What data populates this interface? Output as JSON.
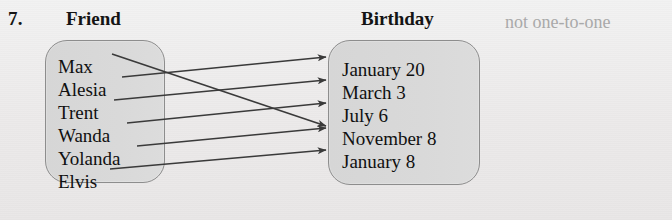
{
  "problem": {
    "number": "7."
  },
  "headers": {
    "domain": "Friend",
    "codomain": "Birthday"
  },
  "caption": {
    "text": "not one-to-one"
  },
  "colors": {
    "page_background": "#efefef",
    "oval_fill": "#d9d9d9",
    "oval_border": "#8d8d8d",
    "text": "#101010",
    "caption_text": "#a9a9a9",
    "arrow": "#3a3a3a"
  },
  "diagram": {
    "type": "mapping-diagram",
    "domain_label": "Friend",
    "codomain_label": "Birthday",
    "domain_items": [
      {
        "label": "Max",
        "x": 58,
        "y": 57
      },
      {
        "label": "Alesia",
        "x": 58,
        "y": 80
      },
      {
        "label": "Trent",
        "x": 58,
        "y": 103
      },
      {
        "label": "Wanda",
        "x": 58,
        "y": 126
      },
      {
        "label": "Yolanda",
        "x": 58,
        "y": 149
      },
      {
        "label": "Elvis",
        "x": 58,
        "y": 172
      }
    ],
    "codomain_items": [
      {
        "label": "January 20",
        "x": 342,
        "y": 60
      },
      {
        "label": "March 3",
        "x": 342,
        "y": 83
      },
      {
        "label": "July 6",
        "x": 342,
        "y": 106
      },
      {
        "label": "November 8",
        "x": 342,
        "y": 129
      },
      {
        "label": "January 8",
        "x": 342,
        "y": 152
      }
    ],
    "arrows": [
      {
        "from": "Max",
        "to": "November 8",
        "x1": 112,
        "y1": 54,
        "x2": 326,
        "y2": 126
      },
      {
        "from": "Alesia",
        "to": "January 20",
        "x1": 122,
        "y1": 77,
        "x2": 326,
        "y2": 57
      },
      {
        "from": "Trent",
        "to": "March 3",
        "x1": 114,
        "y1": 100,
        "x2": 326,
        "y2": 80
      },
      {
        "from": "Wanda",
        "to": "July 6",
        "x1": 127,
        "y1": 123,
        "x2": 326,
        "y2": 103
      },
      {
        "from": "Yolanda",
        "to": "November 8",
        "x1": 137,
        "y1": 146,
        "x2": 326,
        "y2": 128
      },
      {
        "from": "Elvis",
        "to": "January 8",
        "x1": 110,
        "y1": 169,
        "x2": 326,
        "y2": 150
      }
    ],
    "relation_property": "not one-to-one"
  }
}
